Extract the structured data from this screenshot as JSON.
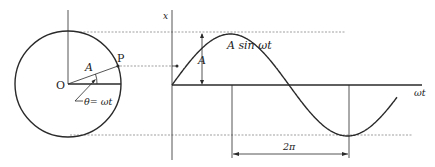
{
  "diagram": {
    "circle": {
      "origin_label": "O",
      "point_label": "P",
      "radius_label": "A",
      "angle_label": "θ= ωt"
    },
    "graph": {
      "y_axis_label": "x",
      "x_axis_label": "ωt",
      "curve_label": "A sin  ωt",
      "amplitude_label": "A",
      "period_label": "2π",
      "cycles_shown": 2
    },
    "colors": {
      "ink": "#2a2a2a",
      "guide": "#777777",
      "background": "#ffffff"
    }
  }
}
